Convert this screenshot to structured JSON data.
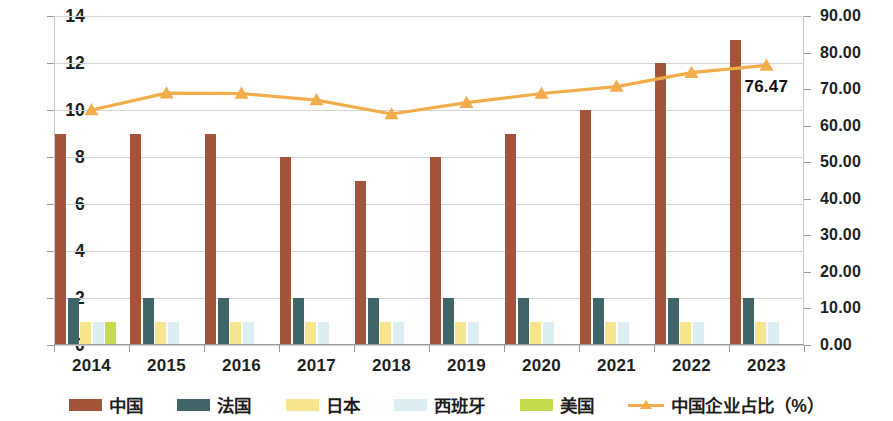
{
  "chart_data": {
    "type": "bar",
    "title": "",
    "subtitle": "",
    "xlabel": "",
    "ylabel": "",
    "y2label": "",
    "categories": [
      "2014",
      "2015",
      "2016",
      "2017",
      "2018",
      "2019",
      "2020",
      "2021",
      "2022",
      "2023"
    ],
    "ylim": [
      0,
      14
    ],
    "yticks": [
      "0",
      "2",
      "4",
      "6",
      "8",
      "10",
      "12",
      "14"
    ],
    "y2lim": [
      0,
      90
    ],
    "y2ticks": [
      "0.00",
      "10.00",
      "20.00",
      "30.00",
      "40.00",
      "50.00",
      "60.00",
      "70.00",
      "80.00",
      "90.00"
    ],
    "grid": true,
    "legend_position": "bottom",
    "series": [
      {
        "name": "中国",
        "type": "bar",
        "axis": "left",
        "color": "#a3543b",
        "values": [
          9,
          9,
          9,
          8,
          7,
          8,
          9,
          10,
          12,
          13
        ]
      },
      {
        "name": "法国",
        "type": "bar",
        "axis": "left",
        "color": "#3f6569",
        "values": [
          2,
          2,
          2,
          2,
          2,
          2,
          2,
          2,
          2,
          2
        ]
      },
      {
        "name": "日本",
        "type": "bar",
        "axis": "left",
        "color": "#f6e58d",
        "values": [
          1,
          1,
          1,
          1,
          1,
          1,
          1,
          1,
          1,
          1
        ]
      },
      {
        "name": "西班牙",
        "type": "bar",
        "axis": "left",
        "color": "#ddeef3",
        "values": [
          1,
          1,
          1,
          1,
          1,
          1,
          1,
          1,
          1,
          1
        ]
      },
      {
        "name": "美国",
        "type": "bar",
        "axis": "left",
        "color": "#c6dc4e",
        "values": [
          1,
          0,
          0,
          0,
          0,
          0,
          0,
          0,
          0,
          0
        ]
      },
      {
        "name": "中国企业占比（%）",
        "type": "line",
        "axis": "right",
        "color": "#f2ad4a",
        "values": [
          64.3,
          68.9,
          68.8,
          67.0,
          63.2,
          66.3,
          68.8,
          70.7,
          74.5,
          76.47
        ]
      }
    ],
    "annotations": [
      {
        "text": "76.47",
        "series": "中国企业占比（%）",
        "category": "2023",
        "value": 76.47
      }
    ]
  },
  "legend": {
    "items": [
      {
        "label": "中国",
        "color": "#a3543b",
        "marker": "swatch"
      },
      {
        "label": "法国",
        "color": "#3f6569",
        "marker": "swatch"
      },
      {
        "label": "日本",
        "color": "#f6e58d",
        "marker": "swatch"
      },
      {
        "label": "西班牙",
        "color": "#ddeef3",
        "marker": "swatch"
      },
      {
        "label": "美国",
        "color": "#c6dc4e",
        "marker": "swatch"
      },
      {
        "label": "中国企业占比（%）",
        "color": "#f2ad4a",
        "marker": "line-triangle"
      }
    ]
  },
  "colors": {
    "china_bar": "#a3543b",
    "france_bar": "#3f6569",
    "japan_bar": "#f6e58d",
    "spain_bar": "#ddeef3",
    "usa_bar": "#c6dc4e",
    "line": "#f2ad4a",
    "grid": "#d4d4d4",
    "axis": "#9a9a9a",
    "text": "#201f1f",
    "background": "#ffffff"
  }
}
